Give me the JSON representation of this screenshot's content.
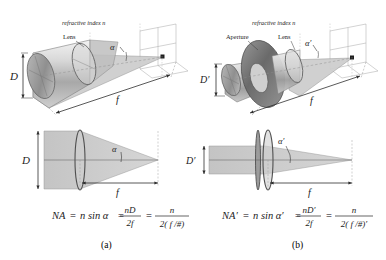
{
  "figure": {
    "background": "#ffffff",
    "ink": "#222222"
  },
  "panels": [
    {
      "id": "a",
      "caption": "(a)",
      "perspective": {
        "medium_label": "refractive index  n",
        "lens_label": "Lens",
        "diameter_label": "D",
        "angle_label": "α",
        "focal_label": "f"
      },
      "section": {
        "diameter_label": "D",
        "angle_label": "α",
        "focal_label": "f"
      },
      "formula": {
        "lhs": "NA",
        "eq1": "=",
        "term1": "n sin α",
        "eq2": "=",
        "frac1_num": "nD",
        "frac1_den": "2f",
        "eq3": "=",
        "frac2_num": "n",
        "frac2_den": "2( f /#)"
      }
    },
    {
      "id": "b",
      "caption": "(b)",
      "perspective": {
        "medium_label": "refractive index  n",
        "aperture_label": "Aperture",
        "lens_label": "Lens",
        "diameter_label": "D′",
        "angle_label": "α′",
        "focal_label": "f"
      },
      "section": {
        "diameter_label": "D′",
        "angle_label": "α′",
        "focal_label": "f"
      },
      "formula": {
        "lhs": "NA′",
        "eq1": "=",
        "term1": "n sin α′",
        "eq2": "=",
        "frac1_num": "nD′",
        "frac1_den": "2f",
        "eq3": "=",
        "frac2_num": "n",
        "frac2_den": "2( f /#)′"
      }
    }
  ],
  "colors": {
    "beam_fill": "#c9c9c9",
    "cylinder_light": "#e8e8e8",
    "cylinder_mid": "#bdbdbd",
    "cylinder_dark": "#8e8e8e",
    "aperture_dark": "#6b6b6b",
    "lens_glass": "#d4d4d4",
    "line": "#3a3a3a",
    "grid": "#9a9a9a"
  }
}
